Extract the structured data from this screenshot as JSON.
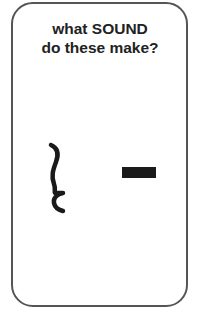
{
  "card": {
    "title_line1": "what SOUND",
    "title_line2": "do these make?"
  },
  "symbols": [
    {
      "name": "squiggle",
      "description": "wavy vertical line (curly-brace-like)"
    },
    {
      "name": "dash",
      "description": "short thick horizontal bar"
    }
  ],
  "colors": {
    "border": "#555555",
    "text": "#222222",
    "symbol": "#1a1a1a",
    "background": "#ffffff"
  }
}
